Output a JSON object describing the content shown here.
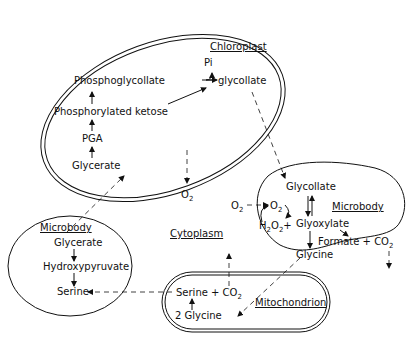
{
  "compartments": {
    "chloroplast": {
      "title": "Chloroplast",
      "metabolites": {
        "pi": "Pi",
        "phosphoglycollate": "Phosphoglycollate",
        "glycollate": "glycollate",
        "phosphorylated_ketose": "Phosphorylated ketose",
        "pga": "PGA",
        "glycerate": "Glycerate"
      }
    },
    "microbody_right": {
      "title": "Microbody",
      "metabolites": {
        "glycollate": "Glycollate",
        "o2": "O",
        "o2_sub": "2",
        "h2o2_h": "H",
        "h2o2_2a": "2",
        "h2o2_o": "O",
        "h2o2_2b": "2",
        "plus": "+",
        "glyoxylate": "Glyoxylate",
        "formate": "Formate + CO",
        "formate_sub": "2",
        "glycine": "Glycine"
      }
    },
    "microbody_left": {
      "title": "Microbody",
      "metabolites": {
        "glycerate": "Glycerate",
        "hydroxypyruvate": "Hydroxypyruvate",
        "serine": "Serine"
      }
    },
    "mitochondrion": {
      "title": "Mitochondrion",
      "metabolites": {
        "serine_co2": "Serine + CO",
        "serine_co2_sub": "2",
        "two_glycine": "2 Glycine"
      }
    },
    "cytoplasm": {
      "title": "Cytoplasm",
      "o2_out": "O",
      "o2_out_sub": "2",
      "o2_in": "O",
      "o2_in_sub": "2"
    }
  },
  "colors": {
    "ink": "#111111",
    "background": "#ffffff"
  }
}
